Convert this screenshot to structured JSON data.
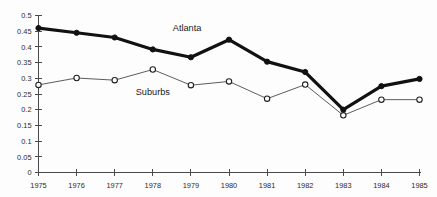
{
  "chart_data": {
    "type": "line",
    "title": "",
    "xlabel": "",
    "ylabel": "",
    "x": [
      1975,
      1976,
      1977,
      1978,
      1979,
      1980,
      1981,
      1982,
      1983,
      1984,
      1985
    ],
    "xtick_labels": [
      "1975",
      "1976",
      "1977",
      "1978",
      "1979",
      "1980",
      "1981",
      "1982",
      "1983",
      "1984",
      "1985"
    ],
    "ytick_labels": [
      "0",
      "0.05",
      "0.1",
      "0.15",
      "0.2",
      "0.25",
      "0.3",
      "0.35",
      "0.4",
      "0.45",
      "0.5"
    ],
    "ytick_values": [
      0,
      0.05,
      0.1,
      0.15,
      0.2,
      0.25,
      0.3,
      0.35,
      0.4,
      0.45,
      0.5
    ],
    "ylim": [
      0,
      0.5
    ],
    "xlim": [
      1975,
      1985
    ],
    "grid": false,
    "legend_position": "inline-annotation",
    "series": [
      {
        "name": "Atlanta",
        "marker": "filled-circle",
        "line_weight": "thick",
        "color": "#111111",
        "values": [
          0.46,
          0.445,
          0.43,
          0.392,
          0.367,
          0.423,
          0.353,
          0.32,
          0.2,
          0.275,
          0.298
        ]
      },
      {
        "name": "Suburbs",
        "marker": "open-circle",
        "line_weight": "thin",
        "color": "#333333",
        "values": [
          0.279,
          0.301,
          0.294,
          0.328,
          0.278,
          0.29,
          0.235,
          0.28,
          0.182,
          0.232,
          0.232
        ]
      }
    ],
    "annotations": [
      {
        "text": "Atlanta",
        "x": 1978.9,
        "y": 0.452
      },
      {
        "text": "Suburbs",
        "x": 1978.0,
        "y": 0.248
      }
    ]
  }
}
